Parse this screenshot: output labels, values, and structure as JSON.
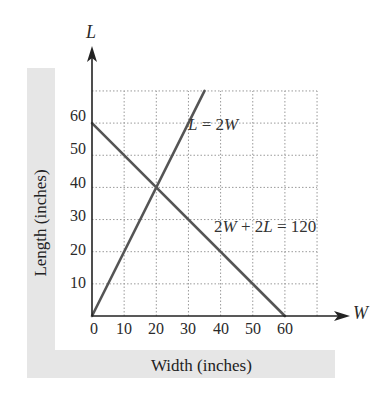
{
  "chart_data": {
    "type": "line",
    "title": "",
    "xlabel": "Width (inches)",
    "ylabel": "Length (inches)",
    "x_axis_variable": "W",
    "y_axis_variable": "L",
    "xlim": [
      0,
      70
    ],
    "ylim": [
      0,
      70
    ],
    "x_ticks": [
      0,
      10,
      20,
      30,
      40,
      50,
      60
    ],
    "y_ticks": [
      10,
      20,
      30,
      40,
      50,
      60
    ],
    "grid": true,
    "grid_style": "dotted",
    "legend": null,
    "series": [
      {
        "name": "L = 2W",
        "equation": "L = 2W",
        "points": [
          [
            0,
            0
          ],
          [
            35,
            70
          ]
        ],
        "color": "#555555"
      },
      {
        "name": "2W + 2L = 120",
        "equation": "2W + 2L = 120",
        "points": [
          [
            0,
            60
          ],
          [
            60,
            0
          ]
        ],
        "color": "#555555"
      }
    ],
    "annotations": [
      {
        "text": "L = 2W",
        "near": [
          30,
          55
        ]
      },
      {
        "text": "2W + 2L = 120",
        "near": [
          50,
          27
        ]
      }
    ],
    "intersection": [
      20,
      40
    ]
  },
  "labels": {
    "y_axis_var": "L",
    "x_axis_var": "W",
    "x_title": "Width (inches)",
    "y_title": "Length (inches)",
    "eq1": {
      "a": "L",
      "b": " = 2",
      "c": "W"
    },
    "eq2": {
      "a": "2",
      "b": "W",
      "c": " + 2",
      "d": "L",
      "e": " = 120"
    },
    "x_ticks": [
      "0",
      "10",
      "20",
      "30",
      "40",
      "50",
      "60"
    ],
    "y_ticks": [
      "60",
      "50",
      "40",
      "30",
      "20",
      "10"
    ]
  },
  "colors": {
    "band": "#e6e6e6",
    "grid": "#9a9a9a",
    "axis": "#222222",
    "line": "#555555"
  }
}
